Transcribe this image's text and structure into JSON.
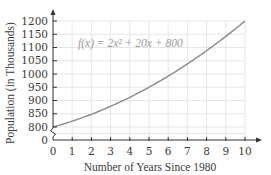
{
  "chart_data": {
    "type": "line",
    "title": "",
    "xlabel": "Number of Years Since 1980",
    "ylabel": "Population (in Thousands)",
    "function_label": "f(x) = 2x² + 20x + 800",
    "x_ticks": [
      "0",
      "1",
      "2",
      "3",
      "4",
      "5",
      "6",
      "7",
      "8",
      "9",
      "10"
    ],
    "y_ticks": [
      "0",
      "800",
      "850",
      "900",
      "950",
      "1000",
      "1050",
      "1100",
      "1150",
      "1200"
    ],
    "xlim": [
      0,
      10
    ],
    "ylim": [
      800,
      1200
    ],
    "axis_break": true,
    "grid": true,
    "series": [
      {
        "name": "f(x) = 2x^2 + 20x + 800",
        "x": [
          0,
          1,
          2,
          3,
          4,
          5,
          6,
          7,
          8,
          9,
          10
        ],
        "values": [
          800,
          822,
          848,
          878,
          912,
          950,
          992,
          1038,
          1088,
          1142,
          1200
        ]
      }
    ],
    "colors": {
      "curve": "#8a8a8a",
      "grid": "#e6e6e6",
      "axis": "#333333",
      "text": "#3a3a3a"
    }
  }
}
